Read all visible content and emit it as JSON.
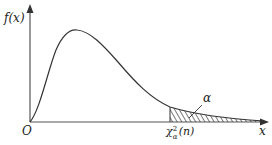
{
  "diagram": {
    "y_axis_label": "f(x)",
    "x_axis_label": "x",
    "origin_label": "O",
    "critical_value_label": {
      "base": "χ",
      "sup": "2",
      "sub": "α",
      "arg": "(n)"
    },
    "tail_area_label": "α",
    "colors": {
      "line": "#333333",
      "background": "#ffffff"
    }
  }
}
